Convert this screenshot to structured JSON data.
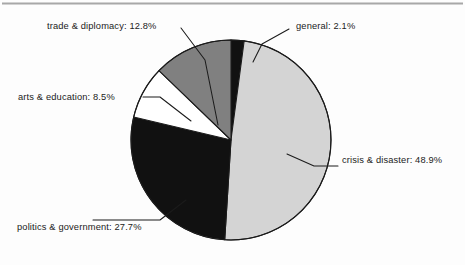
{
  "figure": {
    "background_color": "#fdfdfd",
    "top_rule_color": "#a8a8a8",
    "outline_color": "#1b1b1b"
  },
  "chart_data": {
    "type": "pie",
    "title": "",
    "subtitle": "",
    "xlabel": "",
    "ylabel": "",
    "grid": false,
    "legend_position": "none",
    "label_format": "category: percent",
    "start_angle_clock": "12 o'clock",
    "direction": "clockwise",
    "center": {
      "x": 231,
      "y": 140
    },
    "radius": 100,
    "categories": [
      "general",
      "crisis & disaster",
      "politics & government",
      "arts & education",
      "trade & diplomacy"
    ],
    "values": [
      2.1,
      48.9,
      27.7,
      8.5,
      12.8
    ],
    "slice_colors": [
      "#111111",
      "#d4d4d4",
      "#111111",
      "#ffffff",
      "#808080"
    ],
    "labels": [
      "general: 2.1%",
      "crisis & disaster: 48.9%",
      "politics & government: 27.7%",
      "arts & education: 8.5%",
      "trade & diplomacy: 12.8%"
    ]
  },
  "annotations": {
    "general": {
      "text": "general: 2.1%",
      "x": 296,
      "y": 29
    },
    "crisis_disaster": {
      "text": "crisis & disaster: 48.9%",
      "x": 342,
      "y": 160
    },
    "politics_government": {
      "text": "politics & government: 27.7%",
      "x": 17,
      "y": 227
    },
    "arts_education": {
      "text": "arts & education: 8.5%",
      "x": 18,
      "y": 95
    },
    "trade_diplomacy": {
      "text": "trade & diplomacy: 12.8%",
      "x": 47,
      "y": 29
    }
  }
}
